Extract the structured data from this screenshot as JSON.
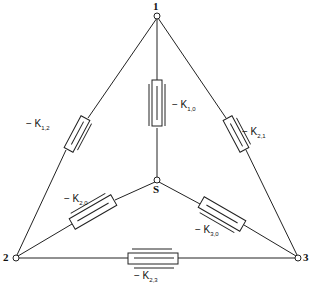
{
  "diagram": {
    "type": "resistor network (delta with star center)",
    "nodes": [
      {
        "id": "1",
        "label": "1",
        "x": 157,
        "y": 16
      },
      {
        "id": "2",
        "label": "2",
        "x": 16,
        "y": 258
      },
      {
        "id": "3",
        "label": "3",
        "x": 298,
        "y": 258
      },
      {
        "id": "S",
        "label": "S",
        "x": 157,
        "y": 180
      }
    ],
    "elements": [
      {
        "id": "k12",
        "from": "1",
        "to": "2",
        "prefix": "− K",
        "sub": "1,2"
      },
      {
        "id": "k10",
        "from": "1",
        "to": "S",
        "prefix": "− K",
        "sub": "1,0"
      },
      {
        "id": "k21",
        "from": "1",
        "to": "3",
        "prefix": "− K",
        "sub": "2,1"
      },
      {
        "id": "k20",
        "from": "S",
        "to": "2",
        "prefix": "− K",
        "sub": "2,0"
      },
      {
        "id": "k30",
        "from": "S",
        "to": "3",
        "prefix": "− K",
        "sub": "3,0"
      },
      {
        "id": "k23",
        "from": "2",
        "to": "3",
        "prefix": "− K",
        "sub": "2,3"
      }
    ]
  }
}
